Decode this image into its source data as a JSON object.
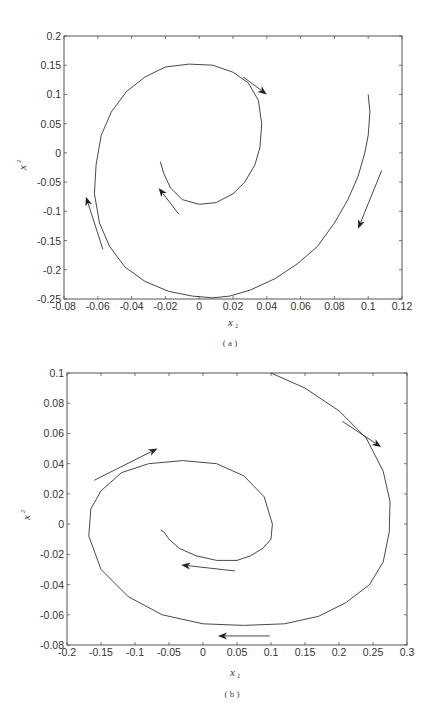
{
  "chart_data": [
    {
      "panel": "a",
      "type": "line",
      "title": "",
      "caption": "( a )",
      "xlabel": "x",
      "xlabel_sub": "1",
      "ylabel": "x",
      "ylabel_sup": "2",
      "xlim": [
        -0.08,
        0.12
      ],
      "ylim": [
        -0.25,
        0.2
      ],
      "xticks": [
        -0.08,
        -0.06,
        -0.04,
        -0.02,
        0,
        0.02,
        0.04,
        0.06,
        0.08,
        0.1,
        0.12
      ],
      "xtick_labels": [
        "-0.08",
        "-0.06",
        "-0.04",
        "-0.02",
        "0",
        "0.02",
        "0.04",
        "0.06",
        "0.08",
        "0.1",
        "0.12"
      ],
      "yticks": [
        -0.25,
        -0.2,
        -0.15,
        -0.1,
        -0.05,
        0,
        0.05,
        0.1,
        0.15,
        0.2
      ],
      "ytick_labels": [
        "-0.25",
        "-0.2",
        "-0.15",
        "-0.1",
        "-0.05",
        "0",
        "0.05",
        "0.1",
        "0.15",
        "0.2"
      ],
      "grid": false,
      "series": [
        {
          "name": "phase trajectory",
          "x": [
            0.1,
            0.101,
            0.1,
            0.098,
            0.094,
            0.088,
            0.08,
            0.07,
            0.058,
            0.045,
            0.03,
            0.018,
            0.008,
            -0.004,
            -0.018,
            -0.032,
            -0.044,
            -0.053,
            -0.059,
            -0.062,
            -0.061,
            -0.058,
            -0.052,
            -0.043,
            -0.032,
            -0.02,
            -0.006,
            0.008,
            0.02,
            0.029,
            0.035,
            0.037,
            0.036,
            0.033,
            0.027,
            0.02,
            0.01,
            0.0,
            -0.01,
            -0.017,
            -0.021,
            -0.023
          ],
          "y": [
            0.1,
            0.07,
            0.03,
            0.0,
            -0.04,
            -0.08,
            -0.12,
            -0.16,
            -0.19,
            -0.215,
            -0.235,
            -0.245,
            -0.248,
            -0.245,
            -0.237,
            -0.22,
            -0.195,
            -0.16,
            -0.12,
            -0.07,
            -0.02,
            0.03,
            0.07,
            0.105,
            0.13,
            0.147,
            0.152,
            0.15,
            0.138,
            0.12,
            0.09,
            0.05,
            0.01,
            -0.02,
            -0.05,
            -0.07,
            -0.085,
            -0.088,
            -0.08,
            -0.06,
            -0.035,
            -0.015
          ]
        }
      ],
      "arrows": [
        {
          "from": [
            0.026,
            0.13
          ],
          "to": [
            0.04,
            0.1
          ]
        },
        {
          "from": [
            0.108,
            -0.03
          ],
          "to": [
            0.094,
            -0.13
          ]
        },
        {
          "from": [
            -0.057,
            -0.165
          ],
          "to": [
            -0.067,
            -0.075
          ]
        },
        {
          "from": [
            -0.012,
            -0.105
          ],
          "to": [
            -0.024,
            -0.06
          ]
        }
      ]
    },
    {
      "panel": "b",
      "type": "line",
      "title": "",
      "caption": "( b )",
      "xlabel": "x",
      "xlabel_sub": "1",
      "ylabel": "x",
      "ylabel_sup": "2",
      "xlim": [
        -0.2,
        0.3
      ],
      "ylim": [
        -0.08,
        0.1
      ],
      "xticks": [
        -0.2,
        -0.15,
        -0.1,
        -0.05,
        0,
        0.05,
        0.1,
        0.15,
        0.2,
        0.25,
        0.3
      ],
      "xtick_labels": [
        "-0.2",
        "-0.15",
        "-0.1",
        "-0.05",
        "0",
        "0.05",
        "0.1",
        "0.15",
        "0.2",
        "0.25",
        "0.3"
      ],
      "yticks": [
        -0.08,
        -0.06,
        -0.04,
        -0.02,
        0,
        0.02,
        0.04,
        0.06,
        0.08,
        0.1
      ],
      "ytick_labels": [
        "-0.08",
        "-0.06",
        "-0.04",
        "-0.02",
        "0",
        "0.02",
        "0.04",
        "0.06",
        "0.08",
        "0.1"
      ],
      "grid": false,
      "series": [
        {
          "name": "phase trajectory",
          "x": [
            0.1,
            0.15,
            0.2,
            0.24,
            0.265,
            0.275,
            0.274,
            0.265,
            0.245,
            0.21,
            0.17,
            0.12,
            0.06,
            0.0,
            -0.06,
            -0.11,
            -0.15,
            -0.168,
            -0.165,
            -0.15,
            -0.12,
            -0.08,
            -0.03,
            0.02,
            0.06,
            0.09,
            0.102,
            0.1,
            0.088,
            0.07,
            0.05,
            0.02,
            -0.01,
            -0.035,
            -0.05,
            -0.058,
            -0.062
          ],
          "y": [
            0.1,
            0.09,
            0.075,
            0.057,
            0.035,
            0.015,
            -0.005,
            -0.025,
            -0.04,
            -0.052,
            -0.061,
            -0.066,
            -0.067,
            -0.066,
            -0.06,
            -0.048,
            -0.03,
            -0.008,
            0.01,
            0.022,
            0.034,
            0.04,
            0.042,
            0.04,
            0.032,
            0.018,
            0.0,
            -0.01,
            -0.016,
            -0.021,
            -0.024,
            -0.024,
            -0.021,
            -0.016,
            -0.01,
            -0.005,
            -0.004
          ]
        }
      ],
      "arrows": [
        {
          "from": [
            0.205,
            0.068
          ],
          "to": [
            0.262,
            0.051
          ]
        },
        {
          "from": [
            -0.16,
            0.029
          ],
          "to": [
            -0.067,
            0.05
          ]
        },
        {
          "from": [
            0.047,
            -0.031
          ],
          "to": [
            -0.032,
            -0.027
          ]
        },
        {
          "from": [
            0.098,
            -0.074
          ],
          "to": [
            0.022,
            -0.074
          ]
        }
      ]
    }
  ],
  "figure": {
    "panels": [
      {
        "id": "a",
        "caption": "( a )",
        "xlabel": "x",
        "xlabel_sub": "1",
        "ylabel": "x",
        "ylabel_sup": "2"
      },
      {
        "id": "b",
        "caption": "( b )",
        "xlabel": "x",
        "xlabel_sub": "1",
        "ylabel": "x",
        "ylabel_sup": "2"
      }
    ]
  }
}
